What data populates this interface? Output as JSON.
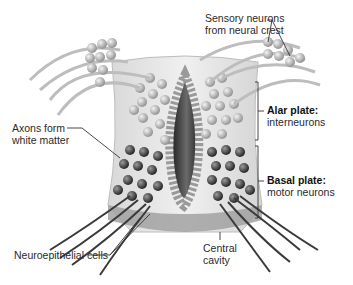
{
  "diagram": {
    "labels": {
      "sensory": {
        "line1": "Sensory neurons",
        "line2": "from neural crest"
      },
      "alar": {
        "title": "Alar plate:",
        "sub": "interneurons"
      },
      "basal": {
        "title": "Basal plate:",
        "sub": "motor neurons"
      },
      "axons": {
        "line1": "Axons form",
        "line2": "white matter"
      },
      "neuroepithelial": {
        "text": "Neuroepithelial cells"
      },
      "central": {
        "line1": "Central",
        "line2": "cavity"
      }
    },
    "colors": {
      "tissue": "#e6e6e6",
      "tissue_edge": "#b5b5b5",
      "alar_cell": "#a9a9a9",
      "basal_cell": "#3a3a3a",
      "cavity": "#4a4a4a",
      "leader": "#333333"
    }
  }
}
